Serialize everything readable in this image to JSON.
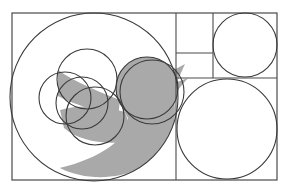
{
  "diagram": {
    "title": "Twitter bird logo golden-ratio circle construction",
    "canvas": {
      "width": 288,
      "height": 194,
      "background": "#ffffff"
    },
    "colors": {
      "stroke": "#3a3a3a",
      "fill_bird": "#a9a9a9",
      "frame": "#4a4a4a"
    },
    "frame": {
      "x": 12,
      "y": 13,
      "width": 265,
      "height": 167
    },
    "grid_lines": [
      {
        "name": "vertical-divider-main",
        "x1": 176,
        "y1": 13,
        "x2": 176,
        "y2": 180
      },
      {
        "name": "vertical-divider-top",
        "x1": 213,
        "y1": 13,
        "x2": 213,
        "y2": 78
      },
      {
        "name": "horizontal-divider-small",
        "x1": 176,
        "y1": 53,
        "x2": 213,
        "y2": 53
      },
      {
        "name": "horizontal-divider-mid",
        "x1": 176,
        "y1": 78,
        "x2": 277,
        "y2": 78
      }
    ],
    "circles": [
      {
        "name": "large-body-circle",
        "cx": 94,
        "cy": 97,
        "r": 84
      },
      {
        "name": "top-right-circle",
        "cx": 245,
        "cy": 45,
        "r": 32
      },
      {
        "name": "bottom-right-circle",
        "cx": 227,
        "cy": 129,
        "r": 50
      },
      {
        "name": "head-circle",
        "cx": 147,
        "cy": 88,
        "r": 31
      },
      {
        "name": "head-circle-outer",
        "cx": 152,
        "cy": 92,
        "r": 32
      },
      {
        "name": "wing-circle-top",
        "cx": 87,
        "cy": 79,
        "r": 30
      },
      {
        "name": "wing-circle-left",
        "cx": 65,
        "cy": 98,
        "r": 26
      },
      {
        "name": "wing-circle-middle",
        "cx": 82,
        "cy": 103,
        "r": 26
      },
      {
        "name": "wing-circle-bottom",
        "cx": 95,
        "cy": 116,
        "r": 29
      }
    ]
  }
}
